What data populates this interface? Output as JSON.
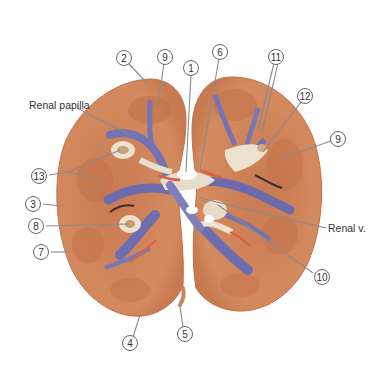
{
  "figure": {
    "colors": {
      "background": "#ffffff",
      "cortex": "#d0875c",
      "cortex_dark": "#b86c44",
      "medulla": "#c9744d",
      "vessel_blue": "#6f6fb0",
      "vessel_pale": "#e9dcc8",
      "artery_red": "#d8604a",
      "label_line": "#8a8a8a",
      "label_text": "#333333"
    },
    "text_labels": {
      "renal_papilla": "Renal papilla",
      "renal_v": "Renal v."
    },
    "number_labels": [
      {
        "id": "n2",
        "text": "2",
        "x": 124,
        "y": 58
      },
      {
        "id": "n9a",
        "text": "9",
        "x": 165,
        "y": 57
      },
      {
        "id": "n1",
        "text": "1",
        "x": 191,
        "y": 68
      },
      {
        "id": "n6",
        "text": "6",
        "x": 220,
        "y": 52
      },
      {
        "id": "n11",
        "text": "11",
        "x": 276,
        "y": 57
      },
      {
        "id": "n12",
        "text": "12",
        "x": 305,
        "y": 96
      },
      {
        "id": "n9b",
        "text": "9",
        "x": 338,
        "y": 139
      },
      {
        "id": "n13",
        "text": "13",
        "x": 39,
        "y": 176
      },
      {
        "id": "n3",
        "text": "3",
        "x": 33,
        "y": 204
      },
      {
        "id": "n8",
        "text": "8",
        "x": 36,
        "y": 226
      },
      {
        "id": "n7",
        "text": "7",
        "x": 41,
        "y": 252
      },
      {
        "id": "n10",
        "text": "10",
        "x": 322,
        "y": 277
      },
      {
        "id": "n4",
        "text": "4",
        "x": 130,
        "y": 343
      },
      {
        "id": "n5",
        "text": "5",
        "x": 185,
        "y": 334
      }
    ]
  }
}
